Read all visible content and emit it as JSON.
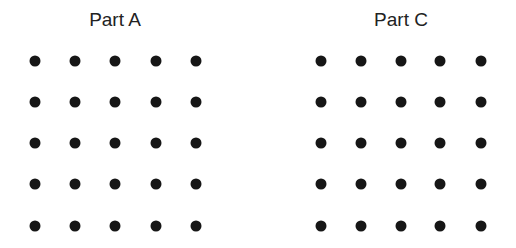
{
  "panels": [
    {
      "id": "part-a",
      "title": "Part A",
      "title_x": 115,
      "columns_x": [
        35,
        75,
        115,
        156,
        196
      ],
      "rows_y": [
        61,
        102,
        143,
        184,
        226
      ]
    },
    {
      "id": "part-c",
      "title": "Part C",
      "title_x": 401,
      "columns_x": [
        321,
        361,
        401,
        440,
        481
      ],
      "rows_y": [
        61,
        102,
        143,
        184,
        226
      ]
    }
  ],
  "dot_color": "#161616",
  "grid": {
    "rows": 5,
    "cols": 5
  }
}
